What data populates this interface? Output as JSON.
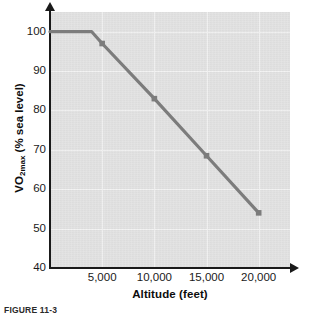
{
  "caption": "FIGURE 11-3",
  "chart_data": {
    "type": "line",
    "title": "",
    "xlabel": "Altitude (feet)",
    "ylabel": "VO2max (% sea level)",
    "ylabel_parts": {
      "pre": "VO",
      "sub": "2max",
      "post": " (% sea level)"
    },
    "x": [
      0,
      4000,
      5000,
      10000,
      15000,
      20000
    ],
    "values": [
      100,
      100,
      97,
      83,
      68.5,
      54
    ],
    "markers_x": [
      5000,
      10000,
      15000,
      20000
    ],
    "markers_y": [
      97,
      83,
      68.5,
      54
    ],
    "xlim": [
      0,
      23000
    ],
    "ylim": [
      40,
      105
    ],
    "xticks": [
      5000,
      10000,
      15000,
      20000
    ],
    "xticklabels": [
      "5,000",
      "10,000",
      "15,000",
      "20,000"
    ],
    "yticks": [
      40,
      50,
      60,
      70,
      80,
      90,
      100
    ],
    "yticklabels": [
      "40",
      "50",
      "60",
      "70",
      "80",
      "90",
      "100"
    ],
    "grid": true,
    "legend": "none",
    "series_color": "#7c7c7c",
    "plot_bg_color": "#e2e2e2",
    "axis_color": "#1a1a1a",
    "grid_color": "#f2f2f2"
  }
}
